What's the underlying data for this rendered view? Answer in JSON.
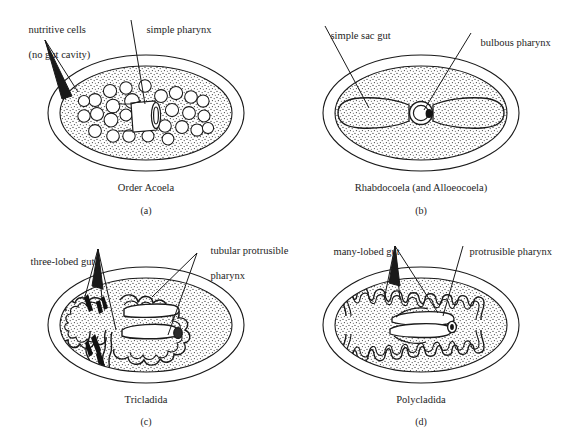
{
  "figure": {
    "background_color": "#ffffff",
    "line_color": "#1a1a1a",
    "stipple_color": "#3a3a3a",
    "partial_bottom_caption": ""
  },
  "panels": [
    {
      "id": "a",
      "letter": "(a)",
      "caption": "Order Acoela",
      "labels": [
        {
          "name": "nutritive-cells",
          "line1": "nutritive cells",
          "line2": "(no gut cavity)"
        },
        {
          "name": "simple-pharynx",
          "line1": "simple pharynx",
          "line2": ""
        }
      ],
      "features": {
        "nutritive_cell_count": 27,
        "gut_cavity": "none",
        "pharynx_type": "simple"
      }
    },
    {
      "id": "b",
      "letter": "(b)",
      "caption": "Rhabdocoela (and Alloeocoela)",
      "labels": [
        {
          "name": "simple-sac-gut",
          "line1": "simple sac gut",
          "line2": ""
        },
        {
          "name": "bulbous-pharynx",
          "line1": "bulbous pharynx",
          "line2": ""
        }
      ],
      "features": {
        "gut_type": "simple sac",
        "gut_lobes": 2,
        "pharynx_type": "bulbous"
      }
    },
    {
      "id": "c",
      "letter": "(c)",
      "caption": "Tricladida",
      "labels": [
        {
          "name": "three-lobed-gut",
          "line1": "three-lobed gut",
          "line2": ""
        },
        {
          "name": "tubular-protrusible-pharynx",
          "line1": "tubular protrusible",
          "line2": "pharynx"
        }
      ],
      "features": {
        "gut_type": "three-lobed",
        "gut_lobes": 3,
        "pharynx_type": "tubular protrusible"
      }
    },
    {
      "id": "d",
      "letter": "(d)",
      "caption": "Polycladida",
      "labels": [
        {
          "name": "many-lobed-gut",
          "line1": "many-lobed gut",
          "line2": ""
        },
        {
          "name": "protrusible-pharynx",
          "line1": "protrusible pharynx",
          "line2": ""
        }
      ],
      "features": {
        "gut_type": "many-lobed",
        "gut_lobes": 24,
        "pharynx_type": "protrusible"
      }
    }
  ]
}
